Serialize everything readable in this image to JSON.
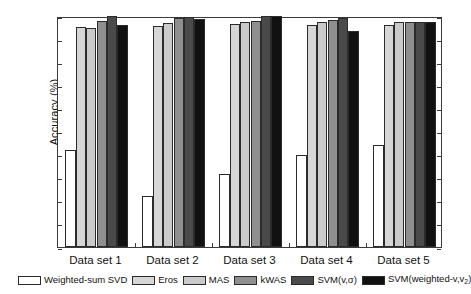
{
  "chart_data": {
    "type": "bar",
    "title": "",
    "xlabel": "",
    "ylabel": "Accuracy (%)",
    "ylim": [
      0,
      100
    ],
    "yticks": [
      0,
      10,
      20,
      30,
      40,
      50,
      60,
      70,
      80,
      90,
      100
    ],
    "grid": false,
    "legend_position": "bottom",
    "categories": [
      "Data set 1",
      "Data set 2",
      "Data set 3",
      "Data set 4",
      "Data set 5"
    ],
    "series": [
      {
        "name": "Weighted-sum SVD",
        "color": "#ffffff",
        "values": [
          42.0,
          22.3,
          31.5,
          39.8,
          44.2
        ]
      },
      {
        "name": "Eros",
        "color": "#d6d6d6",
        "values": [
          95.4,
          95.7,
          96.6,
          95.9,
          96.1
        ]
      },
      {
        "name": "MAS",
        "color": "#cacaca",
        "values": [
          95.0,
          96.8,
          97.6,
          97.5,
          97.4
        ]
      },
      {
        "name": "kWAS",
        "color": "#8f8f8f",
        "values": [
          97.9,
          99.3,
          98.0,
          98.4,
          97.3
        ]
      },
      {
        "name": "SVM(v,σ)",
        "color": "#4a4a4a",
        "values": [
          100.0,
          99.6,
          100.0,
          99.0,
          97.6
        ]
      },
      {
        "name": "SVM(weighted-v,v₂)",
        "color": "#111111",
        "values": [
          96.2,
          98.6,
          100.0,
          93.6,
          97.6
        ]
      }
    ]
  },
  "axis": {
    "ylabel": "Accuracy (%)",
    "ytick_labels": [
      "0",
      "10",
      "20",
      "30",
      "40",
      "50",
      "60",
      "70",
      "80",
      "90",
      "100"
    ]
  },
  "legend": {
    "items": [
      {
        "label": "Weighted-sum SVD",
        "color": "#ffffff"
      },
      {
        "label": "Eros",
        "color": "#d6d6d6"
      },
      {
        "label": "MAS",
        "color": "#cacaca"
      },
      {
        "label": "kWAS",
        "color": "#8f8f8f"
      },
      {
        "label": "SVM(v,σ)",
        "color": "#4a4a4a"
      },
      {
        "label": "SVM(weighted-v,v₂)",
        "color": "#111111"
      }
    ]
  }
}
